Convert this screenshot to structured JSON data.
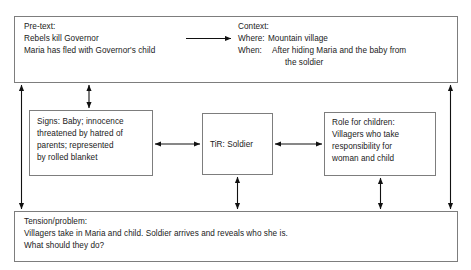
{
  "diagram": {
    "line_color": "#7d7d7d",
    "text_color": "#1a1a1a",
    "arrow_color": "#111111"
  },
  "pretext": {
    "label": "Pre-text:",
    "line1": "Rebels kill Governor",
    "line2": "Maria has fled with Governor's child"
  },
  "context": {
    "label": "Context:",
    "where_key": "Where:",
    "where_value": "Mountain village",
    "when_key": "When:",
    "when_value_line1": "After hiding Maria and the baby from",
    "when_value_line2": "the soldier"
  },
  "signs": {
    "line1": "Signs: Baby; innocence",
    "line2": "threatened by hatred of",
    "line3": "parents; represented",
    "line4": "by rolled blanket"
  },
  "tir": {
    "line1": "TiR: Soldier"
  },
  "role": {
    "line1": "Role for children:",
    "line2": "Villagers who take",
    "line3": "responsibility for",
    "line4": "woman and child"
  },
  "tension": {
    "label": "Tension/problem:",
    "line1": "Villagers take in Maria and child. Soldier arrives and reveals who she is.",
    "line2": "What should they do?"
  },
  "connectors": [
    {
      "name": "pretext-to-context-arrow",
      "style": "single-head-right"
    },
    {
      "name": "top-to-signs-arrow",
      "style": "double-head-vertical"
    },
    {
      "name": "top-to-bottom-left-arrow",
      "style": "double-head-vertical"
    },
    {
      "name": "top-to-bottom-right-arrow",
      "style": "double-head-vertical"
    },
    {
      "name": "signs-to-tir-arrow",
      "style": "double-head-horizontal"
    },
    {
      "name": "tir-to-role-arrow",
      "style": "double-head-horizontal"
    },
    {
      "name": "tir-to-bottom-arrow",
      "style": "double-head-vertical"
    },
    {
      "name": "role-to-bottom-arrow",
      "style": "double-head-vertical"
    }
  ]
}
